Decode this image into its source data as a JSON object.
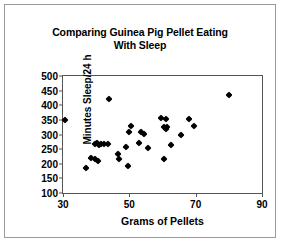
{
  "chart_data": {
    "type": "scatter",
    "title": "Comparing Guinea Pig Pellet Eating With Sleep",
    "title_line1": "Comparing Guinea Pig Pellet Eating",
    "title_line2": "With Sleep",
    "xlabel": "Grams of Pellets",
    "ylabel": "Minutes Sleep/24 h",
    "xlim": [
      30,
      90
    ],
    "ylim": [
      100,
      500
    ],
    "xticks": [
      30,
      50,
      70,
      90
    ],
    "yticks": [
      100,
      150,
      200,
      250,
      300,
      350,
      400,
      450,
      500
    ],
    "grid": false,
    "legend": null,
    "marker": "diamond",
    "marker_color": "#000000",
    "points": [
      {
        "x": 30.5,
        "y": 350
      },
      {
        "x": 37.0,
        "y": 185
      },
      {
        "x": 38.5,
        "y": 220
      },
      {
        "x": 39.5,
        "y": 215
      },
      {
        "x": 40.5,
        "y": 210
      },
      {
        "x": 39.5,
        "y": 267
      },
      {
        "x": 40.2,
        "y": 270
      },
      {
        "x": 40.8,
        "y": 263
      },
      {
        "x": 41.5,
        "y": 268
      },
      {
        "x": 42.5,
        "y": 266
      },
      {
        "x": 43.5,
        "y": 268
      },
      {
        "x": 44.0,
        "y": 420
      },
      {
        "x": 46.5,
        "y": 232
      },
      {
        "x": 47.0,
        "y": 215
      },
      {
        "x": 49.0,
        "y": 257
      },
      {
        "x": 49.5,
        "y": 194
      },
      {
        "x": 50.0,
        "y": 310
      },
      {
        "x": 50.5,
        "y": 330
      },
      {
        "x": 53.0,
        "y": 270
      },
      {
        "x": 53.5,
        "y": 308
      },
      {
        "x": 54.5,
        "y": 303
      },
      {
        "x": 55.5,
        "y": 254
      },
      {
        "x": 59.5,
        "y": 356
      },
      {
        "x": 61.0,
        "y": 353
      },
      {
        "x": 60.5,
        "y": 327
      },
      {
        "x": 61.0,
        "y": 320
      },
      {
        "x": 61.5,
        "y": 324
      },
      {
        "x": 60.5,
        "y": 215
      },
      {
        "x": 62.5,
        "y": 265
      },
      {
        "x": 65.5,
        "y": 300
      },
      {
        "x": 68.0,
        "y": 353
      },
      {
        "x": 69.5,
        "y": 330
      },
      {
        "x": 80.0,
        "y": 435
      }
    ]
  }
}
